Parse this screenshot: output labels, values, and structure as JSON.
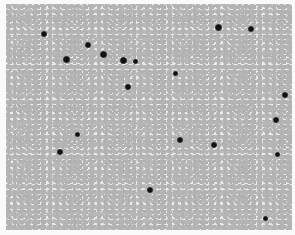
{
  "image": {
    "description": "Grayscale light-microscopy image of a blood smear: dense field of red blood cells with scattered dark-stained nucleated cells",
    "colors": {
      "background": "#fafafa",
      "cells": "#b3b3b3",
      "gaps": "#ececec",
      "dark_nuclei": "#111111"
    },
    "dark_cells": [
      {
        "x": 44,
        "y": 34,
        "r": 3
      },
      {
        "x": 66,
        "y": 59,
        "r": 3.5
      },
      {
        "x": 88,
        "y": 45,
        "r": 3
      },
      {
        "x": 103,
        "y": 54,
        "r": 3.5
      },
      {
        "x": 123,
        "y": 60,
        "r": 3.5
      },
      {
        "x": 135,
        "y": 61,
        "r": 2.5
      },
      {
        "x": 128,
        "y": 87,
        "r": 3
      },
      {
        "x": 218,
        "y": 27,
        "r": 3.5
      },
      {
        "x": 251,
        "y": 29,
        "r": 3
      },
      {
        "x": 175,
        "y": 73,
        "r": 2.5
      },
      {
        "x": 285,
        "y": 95,
        "r": 3
      },
      {
        "x": 276,
        "y": 120,
        "r": 3
      },
      {
        "x": 180,
        "y": 140,
        "r": 3
      },
      {
        "x": 214,
        "y": 145,
        "r": 3
      },
      {
        "x": 277,
        "y": 154,
        "r": 2.5
      },
      {
        "x": 77,
        "y": 134,
        "r": 2.5
      },
      {
        "x": 60,
        "y": 152,
        "r": 3
      },
      {
        "x": 150,
        "y": 190,
        "r": 3
      },
      {
        "x": 265,
        "y": 218,
        "r": 2.5
      }
    ]
  }
}
